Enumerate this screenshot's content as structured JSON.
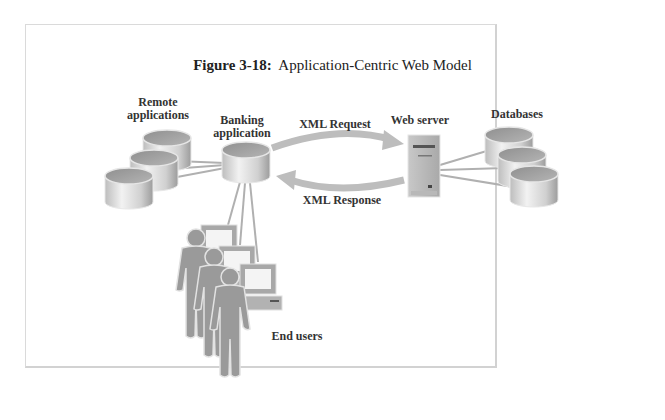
{
  "figure": {
    "number": "Figure 3-18:",
    "title": "Application-Centric Web Model"
  },
  "nodes": {
    "remote_applications": {
      "label_line1": "Remote",
      "label_line2": "applications",
      "count": 3,
      "icon": "database-cylinder-icon"
    },
    "banking_application": {
      "label_line1": "Banking",
      "label_line2": "application",
      "icon": "database-cylinder-icon"
    },
    "web_server": {
      "label": "Web server",
      "icon": "server-tower-icon"
    },
    "databases": {
      "label": "Databases",
      "count": 3,
      "icon": "database-cylinder-icon"
    },
    "end_users": {
      "label": "End users",
      "count": 3,
      "icon": "person-with-computer-icon"
    }
  },
  "edges": {
    "request": {
      "label": "XML Request",
      "from": "Banking application",
      "to": "Web server"
    },
    "response": {
      "label": "XML Response",
      "from": "Web server",
      "to": "Banking application"
    }
  },
  "colors": {
    "frame_border": "#d6d6d6",
    "cylinder_body": "#cfcfcf",
    "cylinder_top": "#9e9e9e",
    "arrow": "#b8b8b8",
    "person": "#9a9a9a",
    "connector": "#aaaaaa",
    "text": "#333333"
  }
}
